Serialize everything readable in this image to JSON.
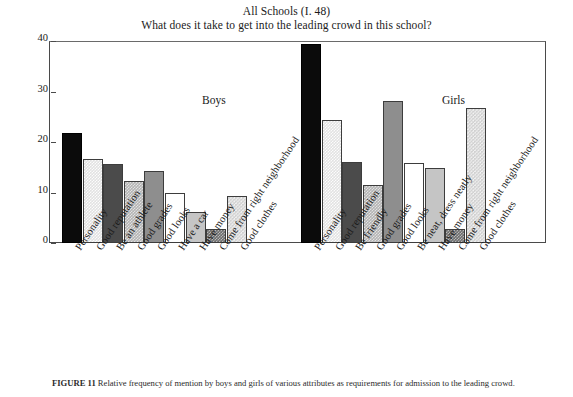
{
  "chart_data": {
    "type": "bar",
    "title": "All Schools (I. 48)",
    "subtitle": "What does it take to get into the leading crowd in this school?",
    "xlabel": "",
    "ylabel": "Percent",
    "ylim": [
      0,
      40
    ],
    "yticks": [
      "0",
      "10",
      "20",
      "30",
      "40"
    ],
    "grid": false,
    "legend": "none",
    "panels": [
      {
        "name": "Boys",
        "categories": [
          "Personality",
          "Good reputation",
          "Be an athlete",
          "Good grades",
          "Good looks",
          "Have a car",
          "Have money",
          "Come from right neighborhood",
          "Good clothes"
        ],
        "values": [
          21.8,
          16.6,
          15.6,
          12.2,
          14.2,
          9.9,
          6.1,
          2.8,
          9.3
        ],
        "fills": [
          "fill-black",
          "fill-ltgrid",
          "fill-dkgray",
          "fill-midchk",
          "fill-gray",
          "fill-white",
          "fill-ltgray",
          "fill-dkchk",
          "fill-lgchk"
        ]
      },
      {
        "name": "Girls",
        "categories": [
          "Personality",
          "Good reputation",
          "Be friendly",
          "Good grades",
          "Good looks",
          "Be neat, dress neatly",
          "Have money",
          "Come from right neighborhood",
          "Good clothes"
        ],
        "values": [
          39.5,
          24.4,
          16.1,
          11.4,
          28.1,
          15.8,
          14.9,
          2.8,
          26.7
        ],
        "fills": [
          "fill-black",
          "fill-ltgrid",
          "fill-dkgray",
          "fill-midchk",
          "fill-gray",
          "fill-white",
          "fill-ltgray",
          "fill-dkchk",
          "fill-lgchk"
        ]
      }
    ]
  },
  "caption": {
    "label": "FIGURE 11",
    "text": "Relative frequency of mention by boys and girls of various attributes as requirements for admission to the leading crowd."
  },
  "colors": {
    "axis": "#4a4a4a",
    "text": "#1a1a1a",
    "bar_outline": "#3d3d3d",
    "background": "#ffffff"
  }
}
